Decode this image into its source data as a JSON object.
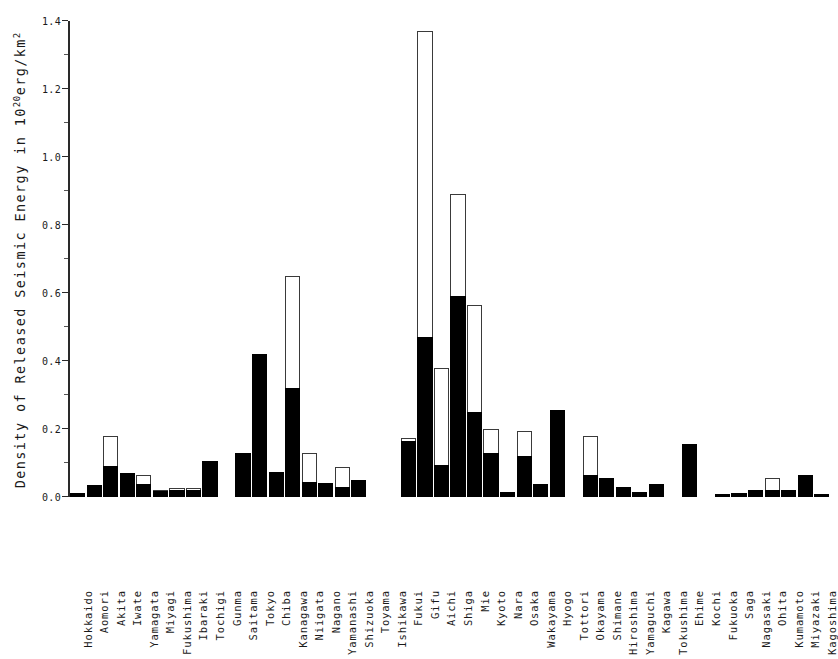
{
  "chart_data": {
    "type": "bar",
    "title": "",
    "subtitle": "",
    "xlabel": "",
    "ylabel": "Density of Released Seismic Energy in 10",
    "ylabel_sup": "20",
    "ylabel_tail": "erg/km",
    "ylabel_tail_sup": "2",
    "ylim": [
      0.0,
      1.4
    ],
    "ymajor_step": 0.2,
    "yminor_step": 0.1,
    "grid": false,
    "legend": [],
    "ytick_labels": [
      "0.0",
      "0.2",
      "0.4",
      "0.6",
      "0.8",
      "1.0",
      "1.2",
      "1.4"
    ],
    "ytick_values": [
      0.0,
      0.2,
      0.4,
      0.6,
      0.8,
      1.0,
      1.2,
      1.4
    ],
    "yminor_values": [
      0.1,
      0.3,
      0.5,
      0.7,
      0.9,
      1.1,
      1.3
    ],
    "series": [
      {
        "name": "filled",
        "style": "solid-black"
      },
      {
        "name": "total",
        "style": "open-outline"
      }
    ],
    "categories": [
      "Hokkaido",
      "Aomori",
      "Akita",
      "Iwate",
      "Yamagata",
      "Miyagi",
      "Fukushima",
      "Ibaraki",
      "Tochigi",
      "Gunma",
      "Saitama",
      "Tokyo",
      "Chiba",
      "Kanagawa",
      "Niigata",
      "Nagano",
      "Yamanashi",
      "Shizuoka",
      "Toyama",
      "Ishikawa",
      "Fukui",
      "Gifu",
      "Aichi",
      "Shiga",
      "Mie",
      "Kyoto",
      "Nara",
      "Osaka",
      "Wakayama",
      "Hyogo",
      "Tottori",
      "Okayama",
      "Shimane",
      "Hiroshima",
      "Yamaguchi",
      "Kagawa",
      "Tokushima",
      "Ehime",
      "Kochi",
      "Fukuoka",
      "Saga",
      "Nagasaki",
      "Ohita",
      "Kumamoto",
      "Miyazaki",
      "Kagoshima"
    ],
    "values_filled": [
      0.012,
      0.035,
      0.09,
      0.072,
      0.038,
      0.018,
      0.02,
      0.022,
      0.105,
      0.0,
      0.13,
      0.42,
      0.075,
      0.32,
      0.045,
      0.04,
      0.028,
      0.05,
      0.0,
      0.0,
      0.165,
      0.47,
      0.095,
      0.59,
      0.25,
      0.13,
      0.015,
      0.12,
      0.038,
      0.255,
      0.0,
      0.065,
      0.055,
      0.03,
      0.016,
      0.038,
      0.0,
      0.155,
      0.0,
      0.01,
      0.013,
      0.022,
      0.02,
      0.02,
      0.065,
      0.01
    ],
    "values_total": [
      0.012,
      0.035,
      0.18,
      0.072,
      0.065,
      0.022,
      0.026,
      0.026,
      0.105,
      0.0,
      0.13,
      0.42,
      0.075,
      0.65,
      0.128,
      0.04,
      0.088,
      0.05,
      0.0,
      0.0,
      0.175,
      1.37,
      0.38,
      0.89,
      0.565,
      0.2,
      0.015,
      0.195,
      0.038,
      0.255,
      0.0,
      0.18,
      0.055,
      0.03,
      0.016,
      0.038,
      0.0,
      0.155,
      0.0,
      0.01,
      0.013,
      0.022,
      0.055,
      0.02,
      0.065,
      0.01
    ]
  }
}
